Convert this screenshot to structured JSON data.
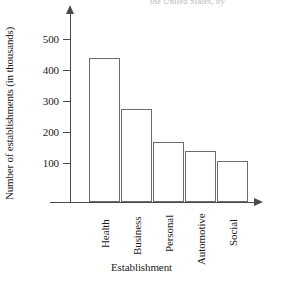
{
  "top_caption": "the United States, by",
  "chart_data": {
    "type": "bar",
    "title": "",
    "xlabel": "Establishment",
    "ylabel": "Number of establishments (in thousands)",
    "categories": [
      "Health",
      "Business",
      "Personal",
      "Automotive",
      "Social"
    ],
    "values": [
      465,
      300,
      195,
      165,
      133
    ],
    "yticks": [
      100,
      200,
      300,
      400,
      500
    ],
    "ylim": [
      0,
      540
    ],
    "grid": false,
    "legend": "none",
    "bar_style": {
      "fill": "#ffffff",
      "stroke": "#6d6d6d"
    },
    "axis_color": "#4a4a4a"
  }
}
